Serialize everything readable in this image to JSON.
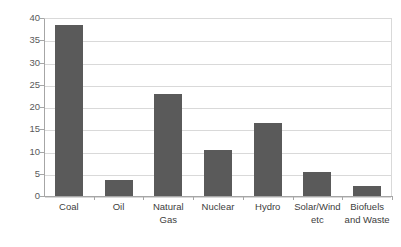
{
  "chart_data": {
    "type": "bar",
    "title": "",
    "xlabel": "",
    "ylabel": "",
    "categories": [
      "Coal",
      "Oil",
      "Natural\nGas",
      "Nuclear",
      "Hydro",
      "Solar/Wind\netc",
      "Biofuels\nand Waste"
    ],
    "values": [
      38.5,
      3.7,
      23.0,
      10.3,
      16.5,
      5.5,
      2.3
    ],
    "ylim": [
      0,
      40
    ],
    "ytick_values": [
      0,
      5,
      10,
      15,
      20,
      25,
      30,
      35,
      40
    ],
    "ytick_labels": [
      "0",
      "5",
      "10",
      "15",
      "20",
      "25",
      "30",
      "35",
      "40"
    ],
    "grid": "horizontal",
    "legend": "none",
    "bar_color": "#5a5a5a",
    "gridline_color": "#d9d9d9",
    "axis_color": "#a6a6a6",
    "plot_background": "#ffffff"
  }
}
